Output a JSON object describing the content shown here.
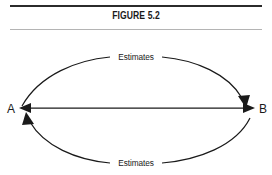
{
  "figure": {
    "title": "FIGURE 5.2",
    "rule_color_top": "#2b2b2b",
    "rule_color_bottom": "#b4b4b4",
    "ink_color": "#1a1a1a",
    "background": "#ffffff"
  },
  "diagram": {
    "type": "node-link",
    "nodes": [
      {
        "id": "A",
        "label": "A"
      },
      {
        "id": "B",
        "label": "B"
      }
    ],
    "edges": [
      {
        "id": "top-arc",
        "from": "A",
        "to": "B",
        "label": "Estimates",
        "shape": "arc-up",
        "arrow": "single-end"
      },
      {
        "id": "middle-line",
        "from": "A",
        "to": "B",
        "label": "",
        "shape": "straight",
        "arrow": "double"
      },
      {
        "id": "bottom-arc",
        "from": "B",
        "to": "A",
        "label": "Estimates",
        "shape": "arc-down",
        "arrow": "single-end"
      }
    ]
  }
}
